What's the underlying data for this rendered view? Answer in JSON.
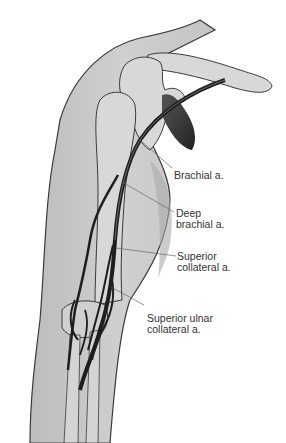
{
  "figure": {
    "labels": [
      {
        "id": "brachial",
        "lines": [
          "Brachial a."
        ]
      },
      {
        "id": "deep-brachial",
        "lines": [
          "Deep",
          "brachial a."
        ]
      },
      {
        "id": "superior-collateral",
        "lines": [
          "Superior",
          "collateral a."
        ]
      },
      {
        "id": "superior-ulnar-collateral",
        "lines": [
          "Superior ulnar",
          "collateral a."
        ]
      }
    ]
  },
  "colors": {
    "skin": "#c8c8c8",
    "bone": "#d8d8d8",
    "artery": "#1e1e1e",
    "outline": "#3a3a3a",
    "leader": "#666666"
  }
}
